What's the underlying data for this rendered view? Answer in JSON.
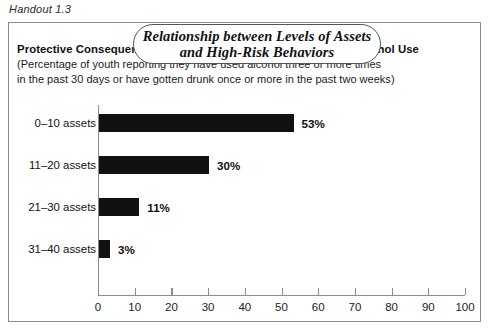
{
  "handout": {
    "label": "Handout 1.3"
  },
  "title": {
    "line1": "Relationship between Levels of Assets",
    "line2": "and High-Risk Behaviors"
  },
  "subtitle": {
    "main": "Protective Consequences of Developmental Assets: Problem Alcohol Use",
    "note_line1": "(Percentage of youth reporting they have used alcohol three or more times",
    "note_line2": "in the past 30 days or have gotten drunk once or more in the past two weeks)"
  },
  "chart_data": {
    "type": "bar",
    "orientation": "horizontal",
    "title": "Protective Consequences of Developmental Assets: Problem Alcohol Use",
    "subtitle": "(Percentage of youth reporting they have used alcohol three or more times in the past 30 days or have gotten drunk once or more in the past two weeks)",
    "categories": [
      "0–10 assets",
      "11–20 assets",
      "21–30 assets",
      "31–40 assets"
    ],
    "values": [
      53,
      30,
      11,
      3
    ],
    "value_labels": [
      "53%",
      "30%",
      "11%",
      "3%"
    ],
    "xlabel": "",
    "ylabel": "",
    "xlim": [
      0,
      100
    ],
    "xticks": [
      0,
      10,
      20,
      30,
      40,
      50,
      60,
      70,
      80,
      90,
      100
    ],
    "xtick_labels": [
      "0",
      "10",
      "20",
      "30",
      "40",
      "50",
      "60",
      "70",
      "80",
      "90",
      "100"
    ],
    "grid": false,
    "legend": "none",
    "bar_color": "#111111",
    "axis_color": "#8b8b8b"
  }
}
